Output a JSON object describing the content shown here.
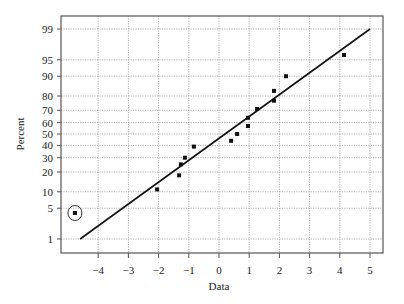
{
  "chart_data": {
    "type": "scatter",
    "title": "",
    "subtitle": "Normal probability plot",
    "xlabel": "Data",
    "ylabel": "Percent",
    "xlim": [
      -5,
      5.5
    ],
    "ylim_percent": [
      0.5,
      99.6
    ],
    "x_ticks": [
      -4,
      -3,
      -2,
      -1,
      0,
      1,
      2,
      3,
      4,
      5
    ],
    "y_ticks": [
      1,
      5,
      10,
      20,
      30,
      40,
      50,
      60,
      70,
      80,
      90,
      95,
      99
    ],
    "y_scale": "normal-probability",
    "grid": true,
    "legend": null,
    "series": [
      {
        "name": "observations",
        "marker": "square",
        "points": [
          {
            "x": -4.77,
            "y": 4,
            "circled": true
          },
          {
            "x": -2.05,
            "y": 11
          },
          {
            "x": -1.32,
            "y": 18
          },
          {
            "x": -1.26,
            "y": 25
          },
          {
            "x": -1.13,
            "y": 30
          },
          {
            "x": -0.83,
            "y": 39
          },
          {
            "x": 0.4,
            "y": 44
          },
          {
            "x": 0.6,
            "y": 50
          },
          {
            "x": 0.96,
            "y": 57
          },
          {
            "x": 0.96,
            "y": 64
          },
          {
            "x": 1.26,
            "y": 71
          },
          {
            "x": 1.82,
            "y": 77
          },
          {
            "x": 1.82,
            "y": 83
          },
          {
            "x": 2.22,
            "y": 90
          },
          {
            "x": 4.14,
            "y": 96
          }
        ]
      },
      {
        "name": "fitted-line",
        "type": "line",
        "points": [
          {
            "x": -4.6,
            "y": 1
          },
          {
            "x": 5.0,
            "y": 99
          }
        ]
      }
    ],
    "annotations": [
      {
        "type": "circle",
        "target": "outlier",
        "x": -4.77,
        "y": 4
      }
    ]
  }
}
